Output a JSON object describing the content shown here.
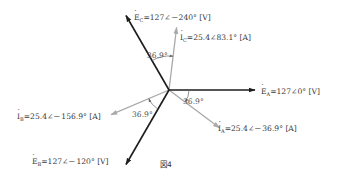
{
  "figure_label": "図4",
  "colors": {
    "voltage": "#1c1c1c",
    "current": "#a9a9a9",
    "angle_mark": "#666666"
  },
  "phasors": {
    "E_A": {
      "symbol": "E",
      "sub": "A",
      "text": "=127∠0° [V]",
      "magnitude": 127,
      "angle_deg": 0,
      "unit": "V",
      "kind": "voltage"
    },
    "E_B": {
      "symbol": "E",
      "sub": "B",
      "text": "=127∠－120° [V]",
      "magnitude": 127,
      "angle_deg": -120,
      "unit": "V",
      "kind": "voltage"
    },
    "E_C": {
      "symbol": "E",
      "sub": "C",
      "text": "=127∠－240° [V]",
      "magnitude": 127,
      "angle_deg": -240,
      "unit": "V",
      "kind": "voltage"
    },
    "I_A": {
      "symbol": "I",
      "sub": "A",
      "text": "=25.4∠－36.9° [A]",
      "magnitude": 25.4,
      "angle_deg": -36.9,
      "unit": "A",
      "kind": "current"
    },
    "I_B": {
      "symbol": "I",
      "sub": "B",
      "text": "=25.4∠－156.9° [A]",
      "magnitude": 25.4,
      "angle_deg": -156.9,
      "unit": "A",
      "kind": "current"
    },
    "I_C": {
      "symbol": "I",
      "sub": "C",
      "text": "=25.4∠83.1° [A]",
      "magnitude": 25.4,
      "angle_deg": 83.1,
      "unit": "A",
      "kind": "current"
    }
  },
  "angle_labels": {
    "A": "36.9°",
    "B": "36.9°",
    "C": "36.9°"
  }
}
